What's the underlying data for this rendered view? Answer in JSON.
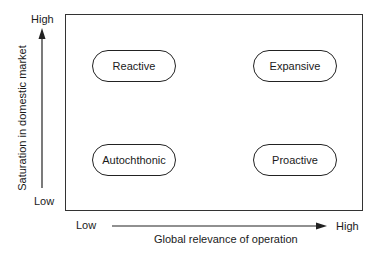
{
  "diagram": {
    "type": "2x2 matrix",
    "y_axis": {
      "label": "Saturation in domestic market",
      "low": "Low",
      "high": "High"
    },
    "x_axis": {
      "label": "Global relevance of operation",
      "low": "Low",
      "high": "High"
    },
    "quadrants": {
      "top_left": "Reactive",
      "top_right": "Expansive",
      "bottom_left": "Autochthonic",
      "bottom_right": "Proactive"
    }
  }
}
